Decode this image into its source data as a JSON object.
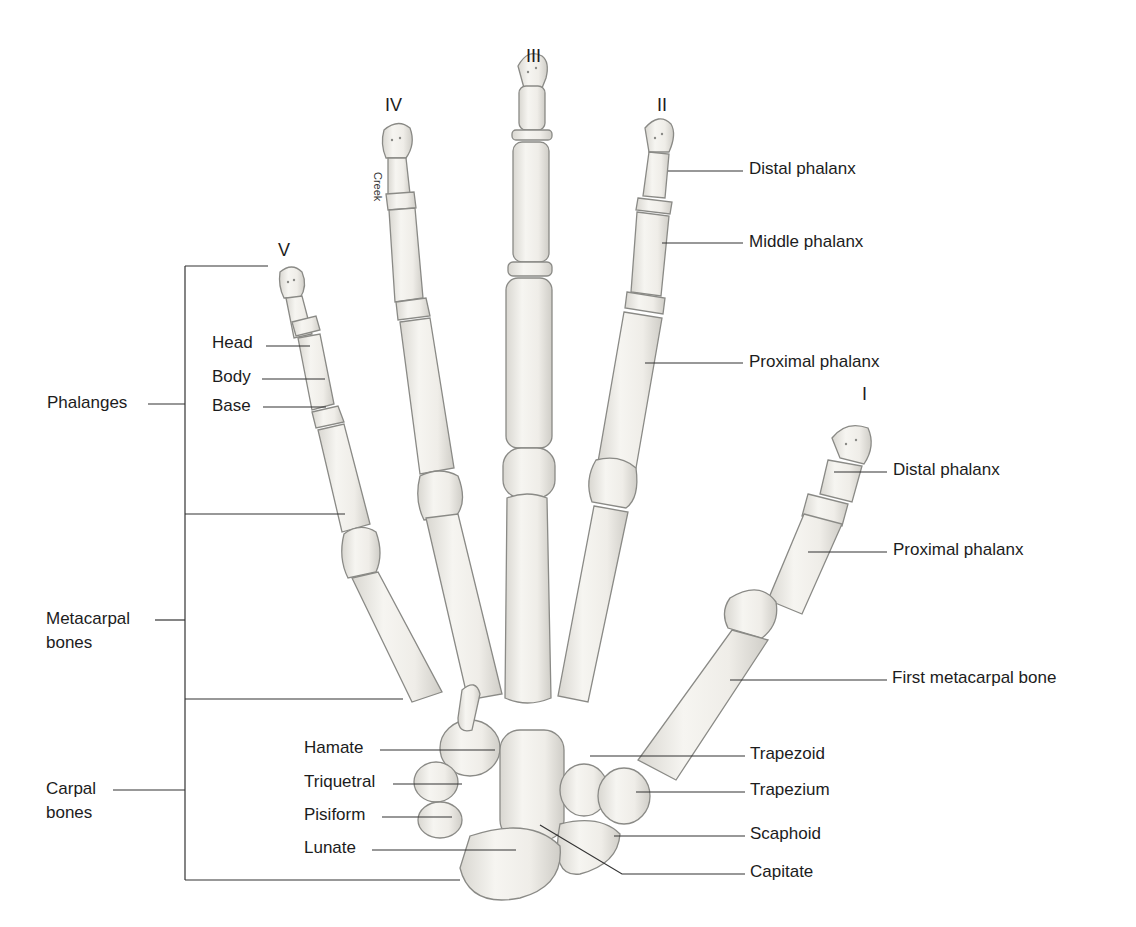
{
  "figure": {
    "fingers": [
      {
        "id": "V",
        "label": "V"
      },
      {
        "id": "IV",
        "label": "IV"
      },
      {
        "id": "III",
        "label": "III"
      },
      {
        "id": "II",
        "label": "II"
      },
      {
        "id": "I",
        "label": "I"
      }
    ],
    "watermark": "Creek",
    "groups": {
      "phalanges": "Phalanges",
      "metacarpal_line1": "Metacarpal",
      "metacarpal_line2": "bones",
      "carpal_line1": "Carpal",
      "carpal_line2": "bones"
    },
    "finger_v_parts": {
      "head": "Head",
      "body": "Body",
      "base": "Base"
    },
    "finger_ii_labels": {
      "distal": "Distal phalanx",
      "middle": "Middle phalanx",
      "proximal": "Proximal phalanx"
    },
    "thumb_labels": {
      "distal": "Distal phalanx",
      "proximal": "Proximal phalanx",
      "metacarpal": "First metacarpal bone"
    },
    "carpal_left": {
      "hamate": "Hamate",
      "triquetral": "Triquetral",
      "pisiform": "Pisiform",
      "lunate": "Lunate"
    },
    "carpal_right": {
      "trapezoid": "Trapezoid",
      "trapezium": "Trapezium",
      "scaphoid": "Scaphoid",
      "capitate": "Capitate"
    },
    "colors": {
      "bone_fill": "#f3f1ec",
      "bone_stroke": "#8a8a86",
      "leader_line": "#333333",
      "text": "#1c1c1c"
    }
  }
}
